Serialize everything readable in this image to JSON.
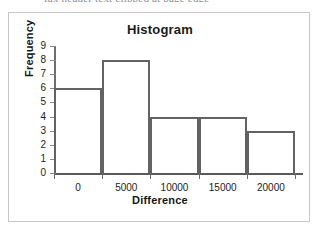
{
  "page": {
    "scan_artifact_text": "fax header text clipped at page edge"
  },
  "chart_data": {
    "type": "bar",
    "title": "Histogram",
    "xlabel": "Difference",
    "ylabel": "Frequency",
    "categories": [
      "0",
      "5000",
      "10000",
      "15000",
      "20000"
    ],
    "values": [
      6,
      8,
      4,
      4,
      3
    ],
    "bins": [
      {
        "label": "0",
        "value": 6
      },
      {
        "label": "5000",
        "value": 8
      },
      {
        "label": "10000",
        "value": 4
      },
      {
        "label": "15000",
        "value": 4
      },
      {
        "label": "20000",
        "value": 3
      }
    ],
    "ylim": [
      0,
      9
    ],
    "yticks": [
      0,
      1,
      2,
      3,
      4,
      5,
      6,
      7,
      8,
      9
    ],
    "ytick_labels": [
      "0",
      "1",
      "2",
      "3",
      "4",
      "5",
      "6",
      "7",
      "8",
      "9"
    ],
    "xtick_labels": [
      "0",
      "5000",
      "10000",
      "15000",
      "20000"
    ],
    "grid": false,
    "legend": false,
    "bar_fill_color": "#ffffff",
    "bar_edge_color": "#636363",
    "axis_color": "#5a5a5a",
    "background_color": "#ffffff",
    "frame_color": "#c8c8c8"
  }
}
